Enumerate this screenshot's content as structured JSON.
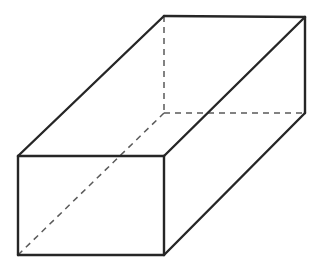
{
  "figure": {
    "background_color": "#ffffff",
    "canvas": {
      "width": 322,
      "height": 272
    }
  },
  "style": {
    "visible_edge_color": "#262626",
    "visible_edge_width": 2.4,
    "hidden_edge_color": "#5a5a5a",
    "hidden_edge_width": 1.5,
    "hidden_dash_pattern": "6,5",
    "face_fill_color": "#ffffff"
  },
  "chart_data": {
    "type": "diagram",
    "shape": "rectangular-prism",
    "projection": "oblique",
    "vertices": {
      "front_top_left": {
        "label": "A",
        "x": 18,
        "y": 156,
        "hidden": false
      },
      "front_top_right": {
        "label": "B",
        "x": 164,
        "y": 156,
        "hidden": false
      },
      "front_bottom_right": {
        "label": "C",
        "x": 164,
        "y": 255,
        "hidden": false
      },
      "front_bottom_left": {
        "label": "D",
        "x": 18,
        "y": 255,
        "hidden": false
      },
      "back_top_left": {
        "label": "E",
        "x": 164,
        "y": 16,
        "hidden": false
      },
      "back_top_right": {
        "label": "F",
        "x": 305,
        "y": 17,
        "hidden": false
      },
      "back_bottom_right": {
        "label": "G",
        "x": 305,
        "y": 113,
        "hidden": false
      },
      "back_bottom_left": {
        "label": "H",
        "x": 164,
        "y": 113,
        "hidden": true
      }
    },
    "offset_vector": {
      "dx": 146,
      "dy": -140
    },
    "edges": [
      {
        "name": "front-top",
        "from": "A",
        "to": "B",
        "style": "solid"
      },
      {
        "name": "front-right",
        "from": "B",
        "to": "C",
        "style": "solid"
      },
      {
        "name": "front-bottom",
        "from": "C",
        "to": "D",
        "style": "solid"
      },
      {
        "name": "front-left",
        "from": "D",
        "to": "A",
        "style": "solid"
      },
      {
        "name": "top-left-receding",
        "from": "A",
        "to": "E",
        "style": "solid"
      },
      {
        "name": "top-right-receding",
        "from": "B",
        "to": "F",
        "style": "solid"
      },
      {
        "name": "bottom-right-receding",
        "from": "C",
        "to": "G",
        "style": "solid"
      },
      {
        "name": "back-top",
        "from": "E",
        "to": "F",
        "style": "solid"
      },
      {
        "name": "back-right",
        "from": "F",
        "to": "G",
        "style": "solid"
      },
      {
        "name": "hidden-back-left",
        "from": "E",
        "to": "H",
        "style": "dashed"
      },
      {
        "name": "hidden-back-bottom",
        "from": "H",
        "to": "G",
        "style": "dashed"
      },
      {
        "name": "hidden-space-diagonal",
        "from": "D",
        "to": "H",
        "style": "dashed"
      }
    ],
    "faces": [
      {
        "name": "front-face",
        "vertices": [
          "A",
          "B",
          "C",
          "D"
        ],
        "visible": true
      },
      {
        "name": "top-face",
        "vertices": [
          "A",
          "E",
          "F",
          "B"
        ],
        "visible": true
      },
      {
        "name": "right-face",
        "vertices": [
          "B",
          "F",
          "G",
          "C"
        ],
        "visible": true
      }
    ],
    "labels": [],
    "legend": null,
    "grid": false
  }
}
